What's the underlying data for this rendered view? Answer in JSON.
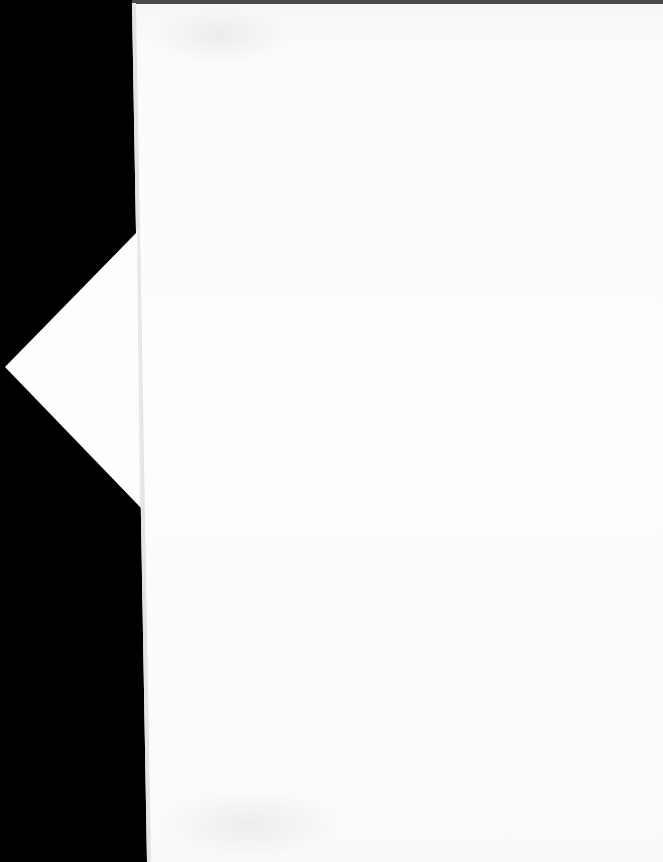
{
  "document": {
    "type": "scanned-page",
    "page_text": "",
    "background_color": "#000000",
    "paper_color": "#fdfdfd",
    "edge_color": "#4a4a4a",
    "has_folded_corner_flap": true
  }
}
